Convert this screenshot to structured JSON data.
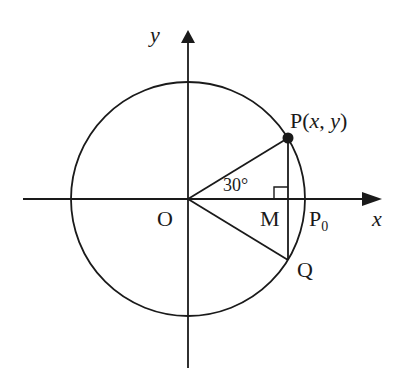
{
  "diagram": {
    "type": "unit-circle",
    "colors": {
      "stroke": "#1a1a1a",
      "background": "#ffffff"
    },
    "axes": {
      "x_label": "x",
      "y_label": "y"
    },
    "labels": {
      "origin": "O",
      "point_p": "P(",
      "point_p_x": "x",
      "point_p_comma": ", ",
      "point_p_y": "y",
      "point_p_close": ")",
      "point_m": "M",
      "point_p0_base": "P",
      "point_p0_sub": "0",
      "point_q": "Q",
      "angle": "30°"
    },
    "geometry": {
      "center": [
        188,
        199
      ],
      "radius": 118,
      "angle_deg": 30
    }
  }
}
